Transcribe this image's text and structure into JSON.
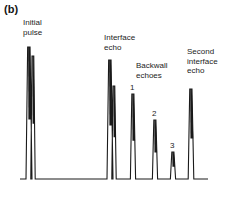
{
  "figure": {
    "panel_label": "(b)",
    "type": "ultrasonic-a-scan-trace",
    "background_color": "#ffffff",
    "trace_color": "#1a1a1a"
  },
  "annotations": {
    "initial_pulse": "Initial\npulse",
    "interface_echo": "Interface\necho",
    "backwall_echoes": "Backwall\nechoes",
    "second_interface_echo": "Second\ninterface\necho"
  },
  "echo_numbers": {
    "one": "1",
    "two": "2",
    "three": "3"
  },
  "chart_data": {
    "type": "line",
    "title": "(b)",
    "xlabel": "",
    "ylabel": "",
    "grid": false,
    "legend_position": "none",
    "baseline_y_px": 179,
    "axis_x_range_px": [
      20,
      208
    ],
    "peaks": [
      {
        "name": "Initial pulse",
        "x_px": 29,
        "top_y_px": 47,
        "height_px": 132,
        "half_width_px": 3.0
      },
      {
        "name": "Initial pulse (tail)",
        "x_px": 33,
        "top_y_px": 56,
        "height_px": 123,
        "half_width_px": 2.2
      },
      {
        "name": "Interface echo",
        "x_px": 110,
        "top_y_px": 60,
        "height_px": 119,
        "half_width_px": 3.0
      },
      {
        "name": "Interface echo (tail)",
        "x_px": 114,
        "top_y_px": 86,
        "height_px": 93,
        "half_width_px": 2.2
      },
      {
        "name": "Backwall echo 1",
        "x_px": 133,
        "top_y_px": 94,
        "height_px": 85,
        "half_width_px": 2.6
      },
      {
        "name": "Backwall echo 2",
        "x_px": 155,
        "top_y_px": 120,
        "height_px": 59,
        "half_width_px": 2.6
      },
      {
        "name": "Backwall echo 3",
        "x_px": 173,
        "top_y_px": 152,
        "height_px": 27,
        "half_width_px": 2.6
      },
      {
        "name": "Second interface echo",
        "x_px": 191,
        "top_y_px": 89,
        "height_px": 90,
        "half_width_px": 2.8
      }
    ]
  }
}
